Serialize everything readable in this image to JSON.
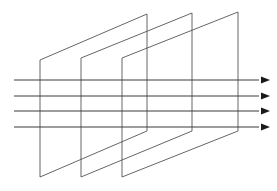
{
  "figure": {
    "background_color": "#ffffff",
    "width": 277,
    "height": 191
  },
  "style": {
    "plane_stroke_color": "#555555",
    "plane_stroke_width": 0.9,
    "ray_stroke_color": "#3a3a3a",
    "ray_stroke_width": 1.0,
    "arrow_fill_color": "#1a1a1a"
  },
  "planes": [
    {
      "name": "plane-1",
      "label": "Plane 1",
      "points": "40,60 147,14 147,131 40,177"
    },
    {
      "name": "plane-2",
      "label": "Plane 2",
      "points": "81,58 192,13 192,131 81,177"
    },
    {
      "name": "plane-3",
      "label": "Plane 3",
      "points": "122,58 238,12 238,131 122,177"
    }
  ],
  "rays": [
    {
      "name": "ray-1",
      "label": "Ray 1",
      "x1": 14,
      "y1": 80,
      "x2": 259,
      "y2": 80,
      "arrow": "261,76.6 270,80 261,83.4"
    },
    {
      "name": "ray-2",
      "label": "Ray 2",
      "x1": 14,
      "y1": 96,
      "x2": 259,
      "y2": 96,
      "arrow": "261,92.6 270,96 261,99.4"
    },
    {
      "name": "ray-3",
      "label": "Ray 3",
      "x1": 14,
      "y1": 111,
      "x2": 259,
      "y2": 111,
      "arrow": "261,107.6 270,111 261,114.4"
    },
    {
      "name": "ray-4",
      "label": "Ray 4",
      "x1": 14,
      "y1": 127,
      "x2": 259,
      "y2": 127,
      "arrow": "261,123.6 270,127 261,130.4"
    }
  ],
  "chart_data": {
    "type": "diagram",
    "plane_count": 3,
    "ray_count": 4,
    "plane_left_x": [
      40,
      81,
      122
    ],
    "plane_right_x": [
      147,
      192,
      238
    ],
    "plane_top_left_y": [
      60,
      58,
      58
    ],
    "plane_top_right_y": [
      14,
      13,
      12
    ],
    "plane_bottom_left_y": [
      177,
      177,
      177
    ],
    "plane_bottom_right_y": [
      131,
      131,
      131
    ],
    "ray_y_values": [
      80,
      96,
      111,
      127
    ],
    "ray_start_x": 14,
    "ray_end_x": 270,
    "grid": false,
    "legend": false
  }
}
